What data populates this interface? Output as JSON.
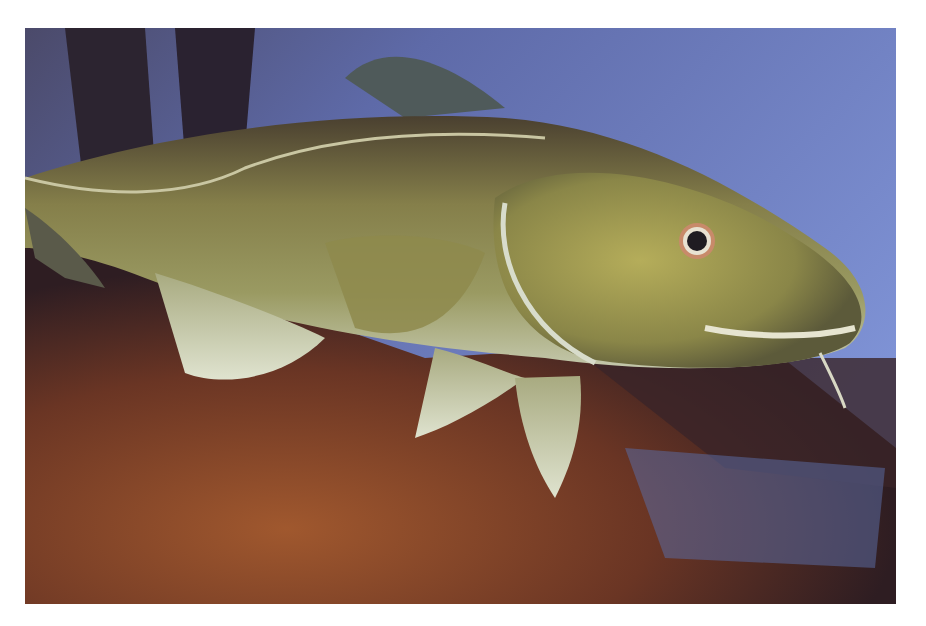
{
  "image": {
    "subject": "Atlantic cod swimming over rocky seabed in aquarium",
    "alt": "Atlantic cod",
    "colors": {
      "water": "#6d7fc4",
      "fish_body": "#8a8a4a",
      "fish_belly": "#c9cfb2",
      "rock": "#8a4a2a",
      "shadow": "#2b1f24"
    }
  }
}
